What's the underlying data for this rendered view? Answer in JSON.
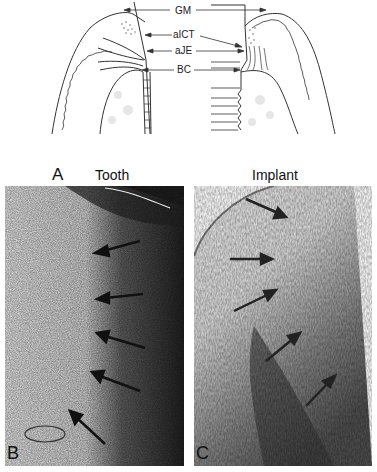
{
  "figure": {
    "diagram": {
      "labels": {
        "gm": "GM",
        "aict": "aICT",
        "aje": "aJE",
        "bc": "BC"
      },
      "panel_letter": "A"
    },
    "panels": {
      "tooth_title": "Tooth",
      "implant_title": "Implant",
      "b_letter": "B",
      "c_letter": "C"
    }
  }
}
